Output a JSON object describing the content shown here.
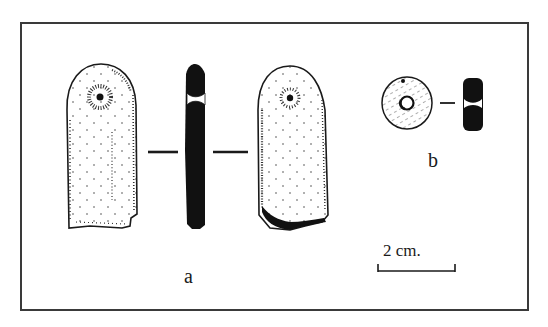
{
  "figure": {
    "type": "archaeological line drawing",
    "objects": [
      {
        "id": "a",
        "label": "a",
        "description": "perforated elongated stone pendant shown in front view, section and back view",
        "views": [
          "front",
          "section",
          "back"
        ]
      },
      {
        "id": "b",
        "label": "b",
        "description": "perforated disc bead shown in face view and section",
        "views": [
          "face",
          "section"
        ]
      }
    ],
    "scale_bar": {
      "label": "2 cm."
    }
  },
  "colors": {
    "ink": "#1a1a1a",
    "frame": "#3a3a3a",
    "background": "#ffffff"
  }
}
